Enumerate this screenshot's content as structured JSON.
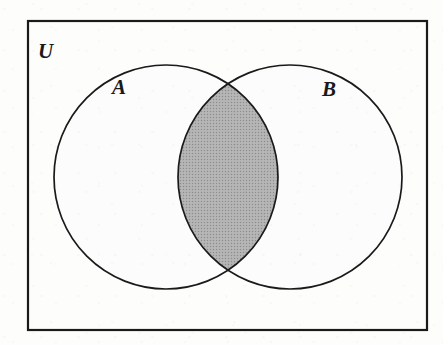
{
  "figure": {
    "kind": "venn-diagram",
    "caption_text": "",
    "background_color": "#fdfdfc",
    "stroke_color": "#1a1a1a"
  },
  "universe": {
    "label": "U",
    "label_x": 38,
    "label_y": 58,
    "rect": {
      "x": 28,
      "y": 21,
      "width": 399,
      "height": 309
    },
    "border_width": 2.2,
    "border_color": "#1a1a1a",
    "fill_color": "#fdfdfc"
  },
  "sets": [
    {
      "id": "A",
      "label": "A",
      "label_x": 112,
      "label_y": 94,
      "center_x": 166,
      "center_y": 177,
      "radius": 112,
      "stroke_color": "#1a1a1a",
      "stroke_width": 1.7,
      "fill_color": "#fcfcfc"
    },
    {
      "id": "B",
      "label": "B",
      "label_x": 322,
      "label_y": 96,
      "center_x": 290,
      "center_y": 177,
      "radius": 112,
      "stroke_color": "#1a1a1a",
      "stroke_width": 1.7,
      "fill_color": "#fcfcfc"
    }
  ],
  "shaded_region": {
    "name": "A-intersect-B",
    "description": "intersection lens",
    "fill_color": "#a8a8a8",
    "pattern": "halftone-dither",
    "top_intersection_x": 228,
    "top_intersection_y": 76,
    "bottom_intersection_x": 228,
    "bottom_intersection_y": 278
  },
  "label_font_size": 21
}
